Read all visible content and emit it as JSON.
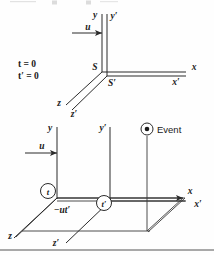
{
  "figure": {
    "caption_fragment_top": "",
    "top_diagram": {
      "name": "coincident-frames-at-t-zero",
      "time_labels": [
        "t = 0",
        "t′ = 0"
      ],
      "origin_labels": [
        "S",
        "S′"
      ],
      "axis_labels": {
        "y": "y",
        "y_prime": "y′",
        "x": "x",
        "x_prime": "x′",
        "z": "z",
        "z_prime": "z′"
      },
      "velocity_label": "u"
    },
    "bottom_diagram": {
      "name": "separated-frames-with-event",
      "axis_labels": {
        "y": "y",
        "y_prime": "y′",
        "x": "x",
        "x_prime": "x′",
        "z": "z",
        "z_prime": "z′"
      },
      "velocity_label": "u",
      "clock_labels": [
        "t",
        "t′"
      ],
      "displacement_label": "−ut′",
      "event_label": "Event",
      "event_marker": "circled-dot-icon"
    },
    "colors": {
      "ink": "#1a1a1a",
      "line": "#2b2b2b",
      "background": "#fefefe",
      "rule": "#555555"
    }
  }
}
